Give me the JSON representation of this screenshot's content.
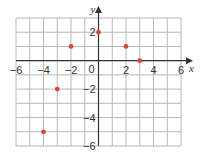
{
  "chart_data": {
    "type": "scatter",
    "title": "",
    "xlabel": "x",
    "ylabel": "y",
    "xlim": [
      -6,
      6
    ],
    "ylim": [
      -6,
      3
    ],
    "grid": true,
    "x_ticks": [
      -6,
      -4,
      -2,
      2,
      4,
      6
    ],
    "y_ticks": [
      2,
      -2,
      -4,
      -6
    ],
    "origin_label": "0",
    "points": [
      {
        "x": 0,
        "y": 2
      },
      {
        "x": -2,
        "y": 1
      },
      {
        "x": 2,
        "y": 1
      },
      {
        "x": 3,
        "y": 0
      },
      {
        "x": -3,
        "y": -2
      },
      {
        "x": -4,
        "y": -5
      }
    ],
    "point_color": "#d9463b",
    "grid_color": "#b8b8b8",
    "axis_color": "#333333"
  }
}
